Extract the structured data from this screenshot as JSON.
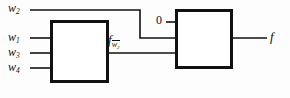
{
  "diagram": {
    "background_color": "#fdfdfd",
    "line_color": "#111111",
    "inputs": [
      {
        "id": "w2",
        "base": "w",
        "sub": "2",
        "overline": false
      },
      {
        "id": "w1",
        "base": "w",
        "sub": "1",
        "overline": false
      },
      {
        "id": "w3",
        "base": "w",
        "sub": "3",
        "overline": false
      },
      {
        "id": "w4",
        "base": "w",
        "sub": "4",
        "overline": false
      }
    ],
    "constant_input": "0",
    "intermediate": {
      "base": "f",
      "sub": "w",
      "sub_index": "2",
      "overline": true
    },
    "output": {
      "base": "f"
    },
    "blocks": [
      {
        "id": "left-block",
        "label": ""
      },
      {
        "id": "right-block",
        "label": ""
      }
    ]
  },
  "labels": {
    "w2": "w",
    "w2_sub": "2",
    "w1": "w",
    "w1_sub": "1",
    "w3": "w",
    "w3_sub": "3",
    "w4": "w",
    "w4_sub": "4",
    "zero": "0",
    "f_cofactor": "f",
    "f_cofactor_sub_base": "w",
    "f_cofactor_sub_index": "2",
    "output": "f"
  }
}
